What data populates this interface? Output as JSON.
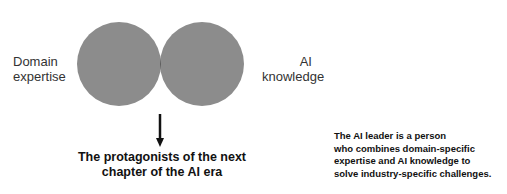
{
  "diagram": {
    "type": "venn",
    "left_label_line1": "Domain",
    "left_label_line2": "expertise",
    "right_label_line1": "AI",
    "right_label_line2": "knowledge",
    "caption_line1": "The protagonists of the next",
    "caption_line2": "chapter of the AI era",
    "note_line1": "The AI leader is a person",
    "note_line2": "who combines domain-specific",
    "note_line3": "expertise and AI knowledge to",
    "note_line4": "solve industry-specific challenges.",
    "colors": {
      "circle": "#8c8c8c",
      "overlap": "#5a5a5a",
      "arrow": "#111111"
    }
  }
}
